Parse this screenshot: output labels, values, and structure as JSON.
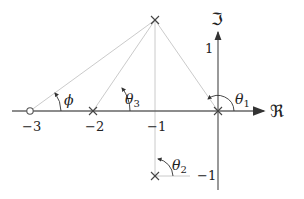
{
  "diagram": {
    "type": "pole-zero-plot",
    "axes": {
      "real_label": "ℜ",
      "imag_label": "ℑ",
      "ticks_real": [
        "−3",
        "−2",
        "−1"
      ],
      "ticks_imag": [
        "1",
        "−1"
      ]
    },
    "zeros": [
      {
        "re": -3,
        "im": 0
      }
    ],
    "poles": [
      {
        "re": -2,
        "im": 0
      },
      {
        "re": -1,
        "im": 1
      },
      {
        "re": -1,
        "im": -1
      },
      {
        "re": 0,
        "im": 0
      }
    ],
    "angles": {
      "phi": "ϕ",
      "theta1": "θ",
      "theta1_sub": "1",
      "theta2": "θ",
      "theta2_sub": "2",
      "theta3": "θ",
      "theta3_sub": "3"
    },
    "colors": {
      "axis": "#555555",
      "construction": "#bbbbbb",
      "marker": "#444444"
    }
  }
}
